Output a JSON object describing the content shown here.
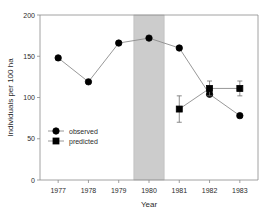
{
  "chart_data": {
    "type": "line",
    "title": "",
    "xlabel": "Year",
    "ylabel": "Individuals per 100 ha",
    "x": [
      1977,
      1978,
      1979,
      1980,
      1981,
      1982,
      1983
    ],
    "xtick_labels": [
      "1977",
      "1978",
      "1979",
      "1980",
      "1981",
      "1982",
      "1983"
    ],
    "ytick_labels": [
      "0",
      "50",
      "100",
      "150",
      "200"
    ],
    "yticks": [
      0,
      50,
      100,
      150,
      200
    ],
    "xlim": [
      1976.4,
      1983.6
    ],
    "ylim": [
      0,
      200
    ],
    "grid": false,
    "legend_position": "inner lower-left",
    "series": [
      {
        "name": "observed",
        "marker": "circle",
        "color": "#000000",
        "x": [
          1977,
          1978,
          1979,
          1980,
          1981,
          1982,
          1983
        ],
        "values": [
          148,
          119,
          166,
          172,
          160,
          104,
          78
        ],
        "errors": [
          null,
          null,
          null,
          null,
          null,
          null,
          null
        ]
      },
      {
        "name": "predicted",
        "marker": "square",
        "color": "#000000",
        "x": [
          1981,
          1982,
          1983
        ],
        "values": [
          86,
          111,
          111
        ],
        "errors": [
          16,
          9,
          9
        ]
      }
    ],
    "annotations": [
      {
        "type": "shaded-band",
        "name": "highlight-band-1980",
        "x_start": 1979.5,
        "x_end": 1980.5,
        "color": "#cccccc"
      }
    ]
  },
  "legend": {
    "items": [
      {
        "label": "observed",
        "marker": "circle"
      },
      {
        "label": "predicted",
        "marker": "square"
      }
    ]
  }
}
